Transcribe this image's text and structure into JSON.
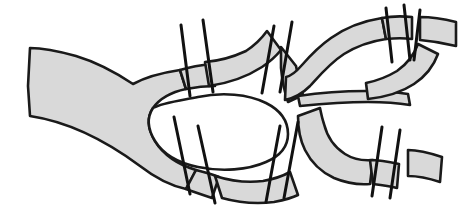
{
  "figure": {
    "kind": "line-art anatomical diagram",
    "width": 462,
    "height": 208,
    "background_color": "#ffffff"
  },
  "style": {
    "fill_color": "#d9d9d9",
    "outline_color": "#1a1a1a",
    "outline_width": 2.6,
    "tick_color": "#111111",
    "tick_width": 3.0,
    "island_fill": "#ffffff"
  },
  "segments": [
    {
      "id": "trunk-left",
      "label": "main trunk (left inflow)",
      "path": "M 28 86 L 30 116 C 70 122 105 140 140 166 C 158 180 172 186 186 189 L 196 170 C 176 164 163 154 155 141 C 147 128 147 117 153 108 C 160 98 172 92 186 89 L 180 70 C 160 73 144 78 133 84 C 118 74 96 62 76 56 C 58 51 42 48 30 48 Z"
    },
    {
      "id": "branch-upper-1",
      "label": "upper branch, first section",
      "path": "M 180 70 L 186 89 C 196 87 206 86 215 86 L 212 64 C 201 65 190 67 180 70 Z"
    },
    {
      "id": "branch-upper-2",
      "label": "upper branch, second section",
      "path": "M 205 62 L 209 86 C 230 83 248 76 262 67 C 271 61 277 55 281 50 L 267 31 C 262 38 255 45 246 51 C 233 57 219 61 205 62 Z"
    },
    {
      "id": "branch-upper-3",
      "label": "upper-middle wedge section",
      "path": "M 281 47 L 296 66 C 298 76 300 86 303 95 L 288 102 C 284 91 282 79 281 68 Z"
    },
    {
      "id": "lobe-upper-right",
      "label": "upper right lobe",
      "path": "M 285 100 C 295 98 303 93 310 86 C 320 75 330 63 344 54 C 357 46 372 41 386 39 L 382 18 C 363 21 345 28 331 38 C 318 47 309 57 302 65 C 296 72 291 76 286 77 L 285 100 Z"
    },
    {
      "id": "branch-upper-right-outlet",
      "label": "upper right outlet band",
      "path": "M 382 18 L 386 39 C 396 38 404 38 412 39 L 412 17 C 402 16 392 16 382 18 Z"
    },
    {
      "id": "branch-upper-right-terminal",
      "label": "upper right terminal band",
      "path": "M 420 17 L 420 40 C 432 41 444 43 456 46 L 456 22 C 444 19 432 17 420 17 Z"
    },
    {
      "id": "branch-lower-1",
      "label": "lower branch, first section",
      "path": "M 186 189 L 196 170 C 204 172 212 174 219 177 L 212 198 C 203 195 194 192 186 189 Z"
    },
    {
      "id": "branch-lower-2",
      "label": "lower branch, second section",
      "path": "M 215 176 L 222 198 C 240 203 258 204 274 202 C 284 200 292 198 298 195 L 290 172 C 283 176 274 179 263 181 C 248 183 231 181 215 176 Z"
    },
    {
      "id": "lobe-lower-right",
      "label": "lower right lobe",
      "path": "M 298 116 C 298 128 300 140 305 150 C 311 162 321 172 334 178 C 346 183 358 185 370 184 L 373 160 C 363 161 353 159 345 154 C 334 147 327 136 324 124 C 322 118 321 113 320 108 L 298 116 Z"
    },
    {
      "id": "branch-lower-right-outlet",
      "label": "lower right outlet band",
      "path": "M 370 160 L 373 184 C 382 185 390 186 397 188 L 399 164 C 390 162 380 160 370 160 Z"
    },
    {
      "id": "branch-lower-right-terminal",
      "label": "lower right terminal band",
      "path": "M 408 150 C 418 150 430 153 442 157 L 440 182 C 428 178 417 176 408 176 Z"
    },
    {
      "id": "connector-mid-right",
      "label": "mid-right connector band",
      "path": "M 300 106 C 320 104 344 102 368 102 C 384 102 398 103 410 105 L 408 94 C 396 92 382 91 366 91 C 342 91 318 93 298 96 Z"
    },
    {
      "id": "lobe-mid-right-upper-tail",
      "label": "mid-right upper tail",
      "path": "M 368 99 C 386 97 402 92 414 84 C 426 76 434 65 438 54 L 418 44 C 414 55 407 64 397 71 C 387 77 376 81 366 83 Z"
    }
  ],
  "island": {
    "id": "central-island",
    "label": "central white island (enclosed void)",
    "path": "M 153 108 C 147 117 147 128 155 141 C 163 154 178 163 198 167 C 222 172 248 170 266 162 C 280 156 288 146 288 134 C 288 121 280 110 266 103 C 248 94 222 92 198 97 C 177 101 161 103 153 108 Z"
  },
  "cut_ticks": [
    {
      "id": "tick-u1",
      "label": "upper cut 1",
      "x1": 181,
      "y1": 25,
      "x2": 190,
      "y2": 96
    },
    {
      "id": "tick-u2",
      "label": "upper cut 2",
      "x1": 203,
      "y1": 20,
      "x2": 213,
      "y2": 92
    },
    {
      "id": "tick-u3",
      "label": "upper cut 3",
      "x1": 274,
      "y1": 26,
      "x2": 262,
      "y2": 93
    },
    {
      "id": "tick-u4",
      "label": "upper cut 4",
      "x1": 292,
      "y1": 22,
      "x2": 280,
      "y2": 92
    },
    {
      "id": "tick-u5",
      "label": "upper right cut 1",
      "x1": 386,
      "y1": 8,
      "x2": 392,
      "y2": 62
    },
    {
      "id": "tick-u6",
      "label": "upper right cut 2",
      "x1": 404,
      "y1": 5,
      "x2": 410,
      "y2": 60
    },
    {
      "id": "tick-l1",
      "label": "lower cut 1",
      "x1": 174,
      "y1": 117,
      "x2": 190,
      "y2": 194
    },
    {
      "id": "tick-l2",
      "label": "lower cut 2",
      "x1": 198,
      "y1": 126,
      "x2": 215,
      "y2": 203
    },
    {
      "id": "tick-l3",
      "label": "lower cut 3",
      "x1": 280,
      "y1": 126,
      "x2": 266,
      "y2": 202
    },
    {
      "id": "tick-l4",
      "label": "lower cut 4",
      "x1": 298,
      "y1": 122,
      "x2": 284,
      "y2": 198
    },
    {
      "id": "tick-l5",
      "label": "lower right cut 1",
      "x1": 382,
      "y1": 127,
      "x2": 372,
      "y2": 196
    },
    {
      "id": "tick-l6",
      "label": "lower right cut 2",
      "x1": 400,
      "y1": 130,
      "x2": 390,
      "y2": 198
    },
    {
      "id": "tick-c1",
      "label": "mid-right cut",
      "x1": 414,
      "y1": 60,
      "x2": 420,
      "y2": 10
    }
  ],
  "accessibility": {
    "description": "A black-and-white line drawing of a branching tubular network, filled with light gray halftone. A wide trunk enters from the left, splits around a central white oval island into an upper and a lower branch, and each branch subdivides again toward the right edge. Short straight tick lines cross the bands at intervals, marking section or cut planes."
  }
}
